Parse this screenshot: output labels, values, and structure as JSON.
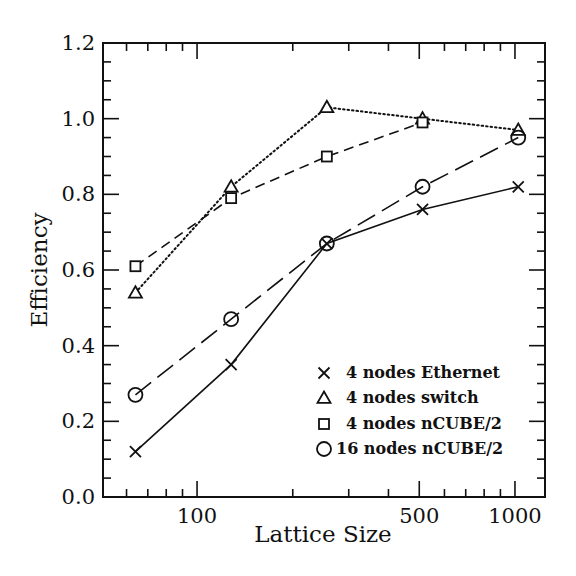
{
  "chart_data": {
    "type": "line",
    "title": "",
    "xlabel": "Lattice Size",
    "ylabel": "Efficiency",
    "xscale": "log",
    "xlim": [
      50.6,
      1243
    ],
    "ylim": [
      0.0,
      1.2
    ],
    "x_tick_labels": [
      {
        "value": 100,
        "label": "100"
      },
      {
        "value": 500,
        "label": "500"
      },
      {
        "value": 1000,
        "label": "1000"
      }
    ],
    "x_minor_ticks": [
      60,
      70,
      80,
      90,
      200,
      300,
      400,
      600,
      700,
      800,
      900
    ],
    "y_tick_labels": [
      {
        "value": 0.0,
        "label": "0.0"
      },
      {
        "value": 0.2,
        "label": "0.2"
      },
      {
        "value": 0.4,
        "label": "0.4"
      },
      {
        "value": 0.6,
        "label": "0.6"
      },
      {
        "value": 0.8,
        "label": "0.8"
      },
      {
        "value": 1.0,
        "label": "1.0"
      },
      {
        "value": 1.2,
        "label": "1.2"
      }
    ],
    "y_minor_step": 0.05,
    "grid": false,
    "legend_position": "lower right",
    "series": [
      {
        "name": "4 nodes Ethernet",
        "marker": "cross",
        "line_style": "solid",
        "x": [
          64,
          128,
          256,
          512,
          1024
        ],
        "values": [
          0.12,
          0.35,
          0.67,
          0.76,
          0.82
        ]
      },
      {
        "name": "4 nodes switch",
        "marker": "triangle",
        "line_style": "dotted",
        "x": [
          64,
          128,
          256,
          512,
          1024
        ],
        "values": [
          0.54,
          0.82,
          1.03,
          1.0,
          0.97
        ]
      },
      {
        "name": "4 nodes nCUBE/2",
        "marker": "square",
        "line_style": "dashed",
        "x": [
          64,
          128,
          256,
          512
        ],
        "values": [
          0.61,
          0.79,
          0.9,
          0.99
        ]
      },
      {
        "name": "16 nodes nCUBE/2",
        "marker": "circle",
        "line_style": "long-dashed",
        "x": [
          64,
          128,
          256,
          512,
          1024
        ],
        "values": [
          0.27,
          0.47,
          0.67,
          0.82,
          0.95
        ]
      }
    ]
  },
  "colors": {
    "ink": "#111111",
    "background": "#ffffff"
  }
}
